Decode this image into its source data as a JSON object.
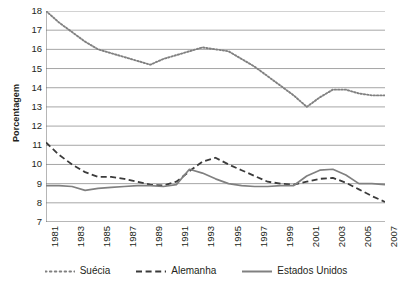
{
  "chart_data": {
    "type": "line",
    "title": "",
    "xlabel": "",
    "ylabel": "Porcentagem",
    "ylim": [
      7,
      18
    ],
    "ytick_step": 1,
    "yticks": [
      18,
      17,
      16,
      15,
      14,
      13,
      12,
      11,
      10,
      9,
      8,
      7
    ],
    "grid": true,
    "legend_position": "bottom",
    "x": [
      1981,
      1982,
      1983,
      1984,
      1985,
      1986,
      1987,
      1988,
      1989,
      1990,
      1991,
      1992,
      1993,
      1994,
      1995,
      1996,
      1997,
      1998,
      1999,
      2000,
      2001,
      2002,
      2003,
      2004,
      2005,
      2006,
      2007
    ],
    "xtick_labels": [
      "1981",
      "1983",
      "1985",
      "1987",
      "1989",
      "1991",
      "1993",
      "1995",
      "1997",
      "1999",
      "2001",
      "2003",
      "2005",
      "2007"
    ],
    "xtick_values": [
      1981,
      1983,
      1985,
      1987,
      1989,
      1991,
      1993,
      1995,
      1997,
      1999,
      2001,
      2003,
      2005,
      2007
    ],
    "series": [
      {
        "name": "Suécia",
        "style": "dotted",
        "color": "#808080",
        "values": [
          18.0,
          17.4,
          16.9,
          16.4,
          16.0,
          15.8,
          15.6,
          15.4,
          15.2,
          15.5,
          15.7,
          15.9,
          16.1,
          16.0,
          15.9,
          15.5,
          15.1,
          14.6,
          14.1,
          13.6,
          13.0,
          13.5,
          13.9,
          13.9,
          13.7,
          13.6,
          13.6
        ]
      },
      {
        "name": "Alemanha",
        "style": "dashed",
        "color": "#3b3b3b",
        "values": [
          11.15,
          10.5,
          10.0,
          9.6,
          9.35,
          9.35,
          9.25,
          9.1,
          8.95,
          8.9,
          9.1,
          9.65,
          10.15,
          10.35,
          10.0,
          9.7,
          9.4,
          9.1,
          9.0,
          8.95,
          9.1,
          9.25,
          9.3,
          9.05,
          8.7,
          8.35,
          8.05
        ]
      },
      {
        "name": "Estados Unidos",
        "style": "solid",
        "color": "#808080",
        "values": [
          8.9,
          8.9,
          8.85,
          8.65,
          8.75,
          8.8,
          8.85,
          8.9,
          8.9,
          8.85,
          8.95,
          9.75,
          9.55,
          9.25,
          9.0,
          8.9,
          8.85,
          8.85,
          8.9,
          8.9,
          9.4,
          9.7,
          9.75,
          9.45,
          9.0,
          9.0,
          8.95
        ]
      }
    ]
  },
  "legend": {
    "items": [
      {
        "label": "Suécia"
      },
      {
        "label": "Alemanha"
      },
      {
        "label": "Estados Unidos"
      }
    ]
  }
}
